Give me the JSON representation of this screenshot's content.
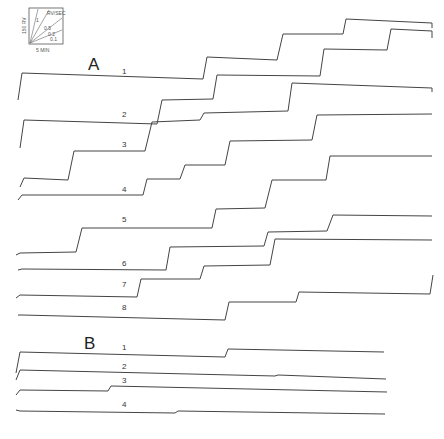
{
  "figure": {
    "calibration": {
      "y_scale": "150 RV",
      "x_scale": "5 MIN",
      "rate_unit": "RV/SEC",
      "rate_lines": [
        "1",
        "0.5",
        "0.2",
        "0.1"
      ]
    },
    "panel_a": {
      "label": "A",
      "traces": [
        {
          "label": "1",
          "points": "18,100 22,73 203,79 207,57 277,60 283,34 343,34 346,19 432,23 432,28"
        },
        {
          "label": "2",
          "points": "20,148 24,120 157,124 162,100 213,99 217,75 320,76 324,49 387,50 391,29 432,31 432,38"
        },
        {
          "label": "3",
          "points": "20,187 24,178 68,180 74,151 145,151 152,122 200,120 204,113 288,111 292,83 432,88 432,92"
        },
        {
          "label": "4",
          "points": "18,200 22,195 143,195 147,179 180,179 185,165 225,165 230,141 312,140 317,115 432,114"
        },
        {
          "label": "5",
          "points": "16,255 20,253 76,252 82,228 212,228 216,209 265,208 272,180 326,180 330,156 432,156"
        },
        {
          "label": "6",
          "points": "18,270 22,269 166,270 170,247 264,246 268,232 327,231 333,215 432,216"
        },
        {
          "label": "7",
          "points": "16,298 20,295 137,297 141,279 200,279 204,266 270,265 275,239 432,240"
        },
        {
          "label": "8",
          "points": "18,315 22,315 225,320 229,302 296,302 299,292 430,294 433,275"
        }
      ],
      "trace_labels_pos": [
        [
          122,
          74
        ],
        [
          122,
          117
        ],
        [
          122,
          147
        ],
        [
          122,
          192
        ],
        [
          122,
          222
        ],
        [
          122,
          266
        ],
        [
          122,
          287
        ],
        [
          122,
          310
        ]
      ]
    },
    "panel_b": {
      "label": "B",
      "traces": [
        {
          "label": "1",
          "points": "16,373 20,352 225,357 228,349 384,352"
        },
        {
          "label": "2",
          "points": "16,380 20,370 275,376 278,375 386,379"
        },
        {
          "label": "3",
          "points": "16,395 20,390 108,391 111,386 387,392"
        },
        {
          "label": "4",
          "points": "16,410 20,411 175,413 178,411 385,414"
        }
      ],
      "trace_labels_pos": [
        [
          122,
          350
        ],
        [
          122,
          369
        ],
        [
          122,
          383
        ],
        [
          122,
          407
        ]
      ]
    }
  }
}
